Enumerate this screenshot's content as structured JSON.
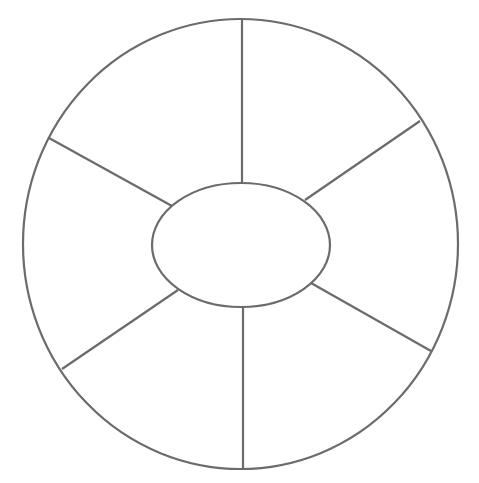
{
  "diagram": {
    "type": "spoke-wheel-graphic-organizer",
    "stroke_color": "#6b6b6b",
    "background_color": "#ffffff",
    "center": {
      "label": ""
    },
    "sector_count": 6,
    "sectors": [
      {
        "id": "top-right",
        "label": ""
      },
      {
        "id": "right",
        "label": ""
      },
      {
        "id": "bottom-right",
        "label": ""
      },
      {
        "id": "bottom-left",
        "label": ""
      },
      {
        "id": "left",
        "label": ""
      },
      {
        "id": "top-left",
        "label": ""
      }
    ]
  }
}
